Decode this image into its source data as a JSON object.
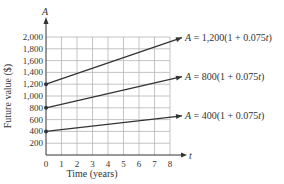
{
  "chart_data": {
    "type": "line",
    "title": "",
    "xlabel": "Time (years)",
    "ylabel": "Future value ($)",
    "x_axis_symbol": "t",
    "y_axis_symbol": "A",
    "xlim": [
      0,
      8
    ],
    "ylim": [
      0,
      2000
    ],
    "x_ticks": [
      "0",
      "1",
      "2",
      "3",
      "4",
      "5",
      "6",
      "7",
      "8"
    ],
    "y_ticks": [
      "200",
      "400",
      "600",
      "800",
      "1,000",
      "1,200",
      "1,400",
      "1,600",
      "1,800",
      "2,000"
    ],
    "grid": true,
    "x": [
      0,
      8
    ],
    "series": [
      {
        "name": "A = 1,200(1 + 0.075t)",
        "values": [
          1200,
          1920
        ],
        "label": "A = 1,200(1 + 0.075t)"
      },
      {
        "name": "A = 800(1 + 0.075t)",
        "values": [
          800,
          1280
        ],
        "label": "A = 800(1 + 0.075t)"
      },
      {
        "name": "A = 400(1 + 0.075t)",
        "values": [
          400,
          640
        ],
        "label": "A = 400(1 + 0.075t)"
      }
    ],
    "legend_position": "right (inline labels with arrows)"
  }
}
